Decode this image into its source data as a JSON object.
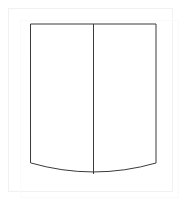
{
  "page": {
    "background_color": "#ffffff",
    "width": 180,
    "height": 201
  },
  "frame": {
    "name": "outer-frame",
    "border_color": "#f1f1f1",
    "inner_border_color": "#fafafa",
    "fill_color": "#ffffff",
    "x": 8,
    "y": 8,
    "width": 165,
    "height": 184
  },
  "figure": {
    "name": "two-panel-shield-outline",
    "stroke_color": "#3a3a3a",
    "fill_color": "#ffffff",
    "stroke_width": 1,
    "geometry": {
      "top_y": 24,
      "left_x": 31,
      "right_x": 156,
      "side_bottom_y": 163,
      "curve_low_y": 174,
      "center_x": 93.5
    },
    "outline_path": "M 31 24 L 156 24 L 156 163 Q 93.5 181 31 163 Z",
    "divider_path": "M 93.5 24 L 93.5 174",
    "panels": [
      {
        "name": "left-panel",
        "label": ""
      },
      {
        "name": "right-panel",
        "label": ""
      }
    ]
  }
}
